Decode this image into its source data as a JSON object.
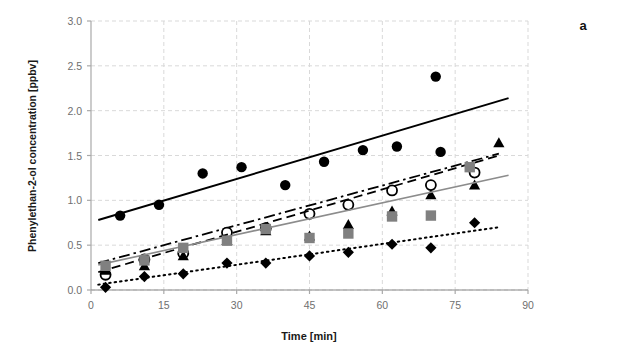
{
  "figure": {
    "panel_letter": "a",
    "background": "#ffffff"
  },
  "chart_data": {
    "type": "scatter",
    "title": "",
    "subtitle": "",
    "xlabel": "Time [min]",
    "ylabel": "Phenylethan-2-ol concentration [ppbv]",
    "xlim": [
      0,
      90
    ],
    "ylim": [
      0.0,
      3.0
    ],
    "xticks": [
      0,
      15,
      30,
      45,
      60,
      75,
      90
    ],
    "xticklabels": [
      "0",
      "15",
      "30",
      "45",
      "60",
      "75",
      "90"
    ],
    "yticks": [
      0.0,
      0.5,
      1.0,
      1.5,
      2.0,
      2.5,
      3.0
    ],
    "yticklabels": [
      "0.0",
      "0.5",
      "1.0",
      "1.5",
      "2.0",
      "2.5",
      "3.0"
    ],
    "grid": true,
    "grid_style": "dashed",
    "grid_color": "#d9d9d9",
    "legend": "none",
    "legend_position": "none",
    "annotations": [],
    "series": [
      {
        "name": "series-filled-circle",
        "marker": "filled-circle",
        "marker_color": "#000000",
        "line_style": "solid",
        "line_color": "#000000",
        "line_width": 2.0,
        "points": [
          {
            "x": 6,
            "y": 0.83
          },
          {
            "x": 14,
            "y": 0.95
          },
          {
            "x": 23,
            "y": 1.3
          },
          {
            "x": 31,
            "y": 1.37
          },
          {
            "x": 40,
            "y": 1.17
          },
          {
            "x": 48,
            "y": 1.43
          },
          {
            "x": 56,
            "y": 1.56
          },
          {
            "x": 63,
            "y": 1.6
          },
          {
            "x": 71,
            "y": 2.38
          },
          {
            "x": 72,
            "y": 1.54
          }
        ],
        "trend": {
          "x0": 1.5,
          "y0": 0.78,
          "x1": 86,
          "y1": 2.14
        }
      },
      {
        "name": "series-open-circle",
        "marker": "open-circle",
        "marker_color": "#000000",
        "marker_fill": "#ffffff",
        "line_style": "dash-dot",
        "line_color": "#000000",
        "line_width": 1.8,
        "points": [
          {
            "x": 3,
            "y": 0.17
          },
          {
            "x": 11,
            "y": 0.34
          },
          {
            "x": 19,
            "y": 0.41
          },
          {
            "x": 28,
            "y": 0.64
          },
          {
            "x": 36,
            "y": 0.69
          },
          {
            "x": 45,
            "y": 0.85
          },
          {
            "x": 53,
            "y": 0.95
          },
          {
            "x": 62,
            "y": 1.11
          },
          {
            "x": 70,
            "y": 1.17
          },
          {
            "x": 79,
            "y": 1.31
          }
        ],
        "trend": {
          "x0": 1.5,
          "y0": 0.3,
          "x1": 84,
          "y1": 1.52
        }
      },
      {
        "name": "series-filled-triangle",
        "marker": "filled-triangle",
        "marker_color": "#000000",
        "line_style": "dashed",
        "line_color": "#000000",
        "line_width": 1.8,
        "points": [
          {
            "x": 3,
            "y": 0.22
          },
          {
            "x": 11,
            "y": 0.27
          },
          {
            "x": 19,
            "y": 0.38
          },
          {
            "x": 28,
            "y": 0.55
          },
          {
            "x": 36,
            "y": 0.66
          },
          {
            "x": 45,
            "y": 0.6
          },
          {
            "x": 53,
            "y": 0.73
          },
          {
            "x": 62,
            "y": 0.88
          },
          {
            "x": 70,
            "y": 1.06
          },
          {
            "x": 79,
            "y": 1.17
          },
          {
            "x": 84,
            "y": 1.64
          }
        ],
        "trend": {
          "x0": 1.5,
          "y0": 0.2,
          "x1": 84,
          "y1": 1.5
        }
      },
      {
        "name": "series-gray-square",
        "marker": "filled-square",
        "marker_color": "#808080",
        "line_style": "solid",
        "line_color": "#8c8c8c",
        "line_width": 1.6,
        "points": [
          {
            "x": 3,
            "y": 0.27
          },
          {
            "x": 11,
            "y": 0.33
          },
          {
            "x": 19,
            "y": 0.47
          },
          {
            "x": 28,
            "y": 0.55
          },
          {
            "x": 36,
            "y": 0.68
          },
          {
            "x": 45,
            "y": 0.58
          },
          {
            "x": 53,
            "y": 0.63
          },
          {
            "x": 62,
            "y": 0.82
          },
          {
            "x": 70,
            "y": 0.83
          },
          {
            "x": 78,
            "y": 1.37
          }
        ],
        "trend": {
          "x0": 1.5,
          "y0": 0.28,
          "x1": 86,
          "y1": 1.28
        }
      },
      {
        "name": "series-filled-diamond",
        "marker": "filled-diamond",
        "marker_color": "#000000",
        "line_style": "dotted",
        "line_color": "#000000",
        "line_width": 2.0,
        "points": [
          {
            "x": 3,
            "y": 0.03
          },
          {
            "x": 11,
            "y": 0.15
          },
          {
            "x": 19,
            "y": 0.18
          },
          {
            "x": 28,
            "y": 0.3
          },
          {
            "x": 36,
            "y": 0.3
          },
          {
            "x": 45,
            "y": 0.38
          },
          {
            "x": 53,
            "y": 0.42
          },
          {
            "x": 62,
            "y": 0.51
          },
          {
            "x": 70,
            "y": 0.47
          },
          {
            "x": 79,
            "y": 0.75
          }
        ],
        "trend": {
          "x0": 1.5,
          "y0": 0.06,
          "x1": 84,
          "y1": 0.7
        }
      }
    ]
  }
}
